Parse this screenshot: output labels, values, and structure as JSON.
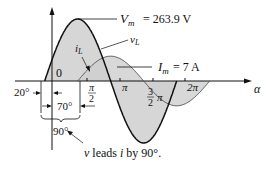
{
  "figure": {
    "type": "phase-diagram",
    "voltage_label": "v",
    "voltage_subscript": "L",
    "current_label": "i",
    "current_subscript": "L",
    "vm_label": "V",
    "vm_subscript": "m",
    "vm_value": "= 263.9 V",
    "im_label": "I",
    "im_subscript": "m",
    "im_value": "= 7 A",
    "origin_label": "0",
    "x_axis_label": "α",
    "ticks": {
      "pi_over_2_num": "π",
      "pi_over_2_den": "2",
      "pi": "π",
      "three_pi_over_2_num": "3",
      "three_pi_over_2_den": "2",
      "three_pi_over_2_suffix": "π",
      "two_pi": "2π"
    },
    "angle_20": "20°",
    "angle_70": "70°",
    "angle_90": "90°",
    "caption_v": "v",
    "caption_mid": " leads ",
    "caption_i": "i",
    "caption_end": " by 90°.",
    "voltage_phase_deg": 20,
    "current_phase_deg": -70,
    "amplitude_ratio": 0.4,
    "fill_color": "#d4d4d4",
    "line_color": "#111111"
  }
}
